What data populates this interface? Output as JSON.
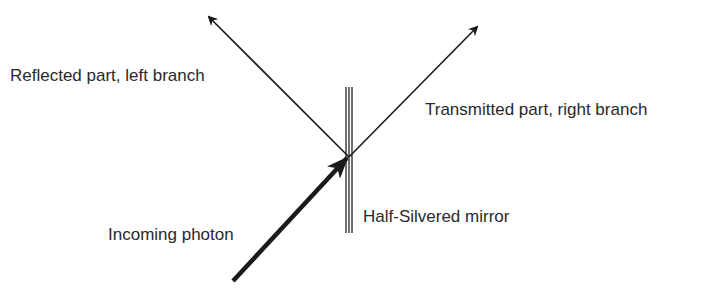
{
  "diagram": {
    "title": "",
    "labels": {
      "reflected": "Reflected part, left branch",
      "transmitted": "Transmitted part, right branch",
      "incoming": "Incoming photon",
      "mirror": "Half-Silvered mirror"
    },
    "colors": {
      "stroke": "#1a1a1a",
      "text": "#2a2a2a",
      "background": "#ffffff"
    },
    "geometry": {
      "split_point": [
        349,
        157
      ],
      "mirror": {
        "x": [
          346,
          349,
          352
        ],
        "y_top": 87,
        "y_bottom": 233
      },
      "reflected_arrow": {
        "from": [
          349,
          157
        ],
        "to": [
          209,
          17
        ]
      },
      "transmitted_arrow": {
        "from": [
          349,
          157
        ],
        "to": [
          477,
          27
        ]
      },
      "incoming_arrow": {
        "from": [
          233,
          281
        ],
        "to": [
          349,
          157
        ]
      }
    }
  }
}
